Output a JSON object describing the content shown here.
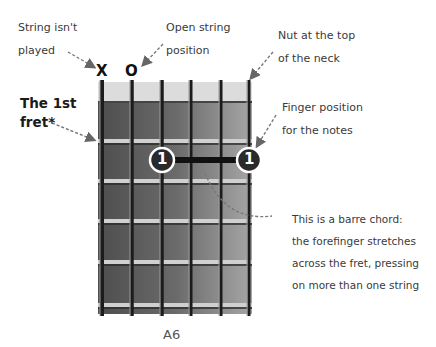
{
  "annotations": {
    "string_not_played": [
      "String isn't",
      "played"
    ],
    "open_string": [
      "Open string",
      "position"
    ],
    "nut": [
      "Nut at the top",
      "of the neck"
    ],
    "first_fret": [
      "The 1st",
      "fret*"
    ],
    "finger_position": [
      "Finger position",
      "for the notes"
    ],
    "barre_chord": [
      "This is a barre chord:",
      "the forefinger stretches",
      "across the fret, pressing",
      "on more than one string"
    ]
  },
  "markers": {
    "muted": "X",
    "open": "O"
  },
  "fingering": {
    "finger_number": "1",
    "barre_from_string": 3,
    "barre_to_string": 6,
    "fret": 2
  },
  "chord": {
    "name": "A6"
  },
  "fretboard": {
    "strings": 6,
    "frets_shown": 5
  }
}
